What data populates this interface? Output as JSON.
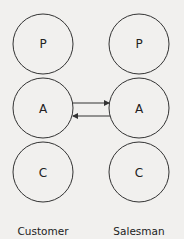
{
  "diagram": {
    "columns": [
      {
        "name": "Customer",
        "states": [
          "P",
          "A",
          "C"
        ]
      },
      {
        "name": "Salesman",
        "states": [
          "P",
          "A",
          "C"
        ]
      }
    ],
    "transactions": [
      {
        "from": "Customer.A",
        "to": "Salesman.A",
        "direction": "right"
      },
      {
        "from": "Salesman.A",
        "to": "Customer.A",
        "direction": "left"
      }
    ],
    "colors": {
      "stroke": "#333333",
      "background": "#f1f0ee"
    }
  }
}
